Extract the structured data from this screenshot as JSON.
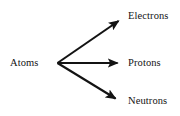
{
  "diagram": {
    "background_color": "#ffffff",
    "stroke_color": "#131313",
    "source_node": {
      "id": "atoms",
      "label": "Atoms"
    },
    "target_nodes": [
      {
        "id": "electrons",
        "label": "Electrons"
      },
      {
        "id": "protons",
        "label": "Protons"
      },
      {
        "id": "neutrons",
        "label": "Neutrons"
      }
    ],
    "edges": [
      {
        "from": "Atoms",
        "to": "Electrons",
        "direction": "up-right",
        "arrowhead": "filled-triangle"
      },
      {
        "from": "Atoms",
        "to": "Protons",
        "direction": "right",
        "arrowhead": "filled-triangle"
      },
      {
        "from": "Atoms",
        "to": "Neutrons",
        "direction": "down-right",
        "arrowhead": "filled-triangle"
      }
    ]
  }
}
